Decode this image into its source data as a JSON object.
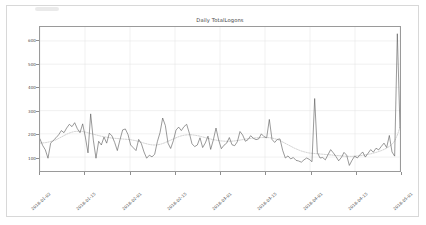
{
  "window": {
    "background_color": "#ffffff",
    "card_border_color": "#d8d8d8"
  },
  "chart_data": {
    "type": "line",
    "title": "Daily TotalLogons",
    "xlabel": "",
    "ylabel": "",
    "grid": true,
    "legend_position": "none",
    "ylim": [
      40,
      660
    ],
    "yticks": [
      100,
      200,
      300,
      400,
      500,
      600
    ],
    "ytick_labels": [
      "100",
      "200",
      "300",
      "400",
      "500",
      "600"
    ],
    "xlim": [
      "2018-01-02",
      "2018-05-01"
    ],
    "xticks": [
      "2018-01-02",
      "2018-01-15",
      "2018-02-01",
      "2018-02-15",
      "2018-03-01",
      "2018-03-15",
      "2018-04-01",
      "2018-04-15",
      "2018-05-01"
    ],
    "xtick_labels": [
      "2018-01-02",
      "2018-01-15",
      "2018-02-01",
      "2018-02-15",
      "2018-03-01",
      "2018-03-15",
      "2018-04-01",
      "2018-04-15",
      "2018-05-01"
    ],
    "series": [
      {
        "name": "Daily TotalLogons",
        "style": "solid",
        "color": "#555555",
        "width": 0.6,
        "values": [
          178,
          150,
          131,
          95,
          160,
          172,
          183,
          196,
          214,
          205,
          225,
          241,
          231,
          248,
          222,
          205,
          243,
          186,
          118,
          286,
          173,
          95,
          168,
          152,
          186,
          160,
          203,
          191,
          163,
          128,
          175,
          217,
          221,
          197,
          152,
          140,
          128,
          176,
          158,
          122,
          95,
          108,
          101,
          112,
          166,
          205,
          268,
          236,
          160,
          137,
          170,
          216,
          229,
          214,
          231,
          241,
          203,
          157,
          145,
          152,
          183,
          141,
          161,
          190,
          133,
          174,
          225,
          173,
          136,
          151,
          160,
          184,
          153,
          149,
          166,
          210,
          195,
          168,
          175,
          192,
          181,
          175,
          178,
          200,
          188,
          183,
          262,
          176,
          163,
          176,
          178,
          129,
          96,
          105,
          92,
          98,
          86,
          83,
          78,
          88,
          96,
          90,
          80,
          352,
          120,
          96,
          98,
          88,
          110,
          132,
          118,
          102,
          84,
          98,
          120,
          108,
          64,
          86,
          104,
          96,
          110,
          122,
          100,
          116,
          132,
          121,
          138,
          131,
          146,
          160,
          141,
          193,
          122,
          104,
          631,
          225
        ]
      },
      {
        "name": "Trend (moving average)",
        "style": "dotted",
        "color": "#b6b6b6",
        "width": 0.6,
        "values": [
          160,
          161,
          162,
          164,
          167,
          170,
          174,
          180,
          186,
          192,
          198,
          203,
          207,
          210,
          211,
          211,
          210,
          208,
          205,
          202,
          199,
          196,
          193,
          190,
          188,
          186,
          184,
          182,
          181,
          180,
          179,
          178,
          177,
          176,
          175,
          173,
          171,
          168,
          165,
          161,
          158,
          155,
          153,
          152,
          152,
          154,
          157,
          161,
          166,
          171,
          176,
          181,
          186,
          190,
          193,
          195,
          196,
          196,
          195,
          193,
          191,
          188,
          185,
          182,
          179,
          176,
          174,
          172,
          170,
          169,
          168,
          168,
          168,
          169,
          170,
          172,
          174,
          176,
          178,
          180,
          181,
          182,
          183,
          184,
          184,
          184,
          184,
          183,
          181,
          178,
          174,
          169,
          163,
          157,
          151,
          145,
          139,
          134,
          129,
          125,
          122,
          119,
          117,
          116,
          115,
          114,
          113,
          112,
          111,
          110,
          109,
          108,
          107,
          106,
          105,
          104,
          103,
          103,
          103,
          104,
          105,
          106,
          108,
          110,
          112,
          114,
          117,
          120,
          124,
          128,
          133,
          139,
          146,
          155,
          170,
          195,
          228
        ]
      }
    ]
  }
}
